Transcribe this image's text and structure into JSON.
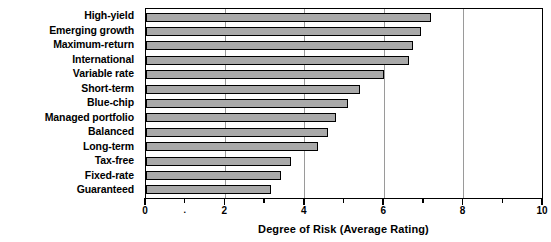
{
  "chart_data": {
    "type": "bar",
    "orientation": "horizontal",
    "title": "",
    "xlabel": "Degree of Risk (Average Rating)",
    "ylabel": "",
    "xlim": [
      0,
      10
    ],
    "grid": true,
    "legend": null,
    "bar_color": "#a9a9a9",
    "bar_edge_color": "#000000",
    "background_color": "#ffffff",
    "x_major_ticks": [
      0,
      2,
      4,
      6,
      8,
      10
    ],
    "x_minor_ticks": [
      1,
      3,
      5,
      7,
      9
    ],
    "x_tick_labels": [
      "0",
      "",
      "2",
      "4",
      "6",
      "8",
      "10"
    ],
    "gridline_values": [
      2,
      4,
      6,
      8
    ],
    "categories": [
      "High-yield",
      "Emerging growth",
      "Maximum-return",
      "International",
      "Variable rate",
      "Short-term",
      "Blue-chip",
      "Managed portfolio",
      "Balanced",
      "Long-term",
      "Tax-free",
      "Fixed-rate",
      "Guaranteed"
    ],
    "values": [
      7.2,
      6.95,
      6.75,
      6.65,
      6.0,
      5.4,
      5.1,
      4.8,
      4.6,
      4.35,
      3.65,
      3.4,
      3.15
    ]
  },
  "axis": {
    "x_title": "Degree of Risk (Average Rating)",
    "labels": {
      "t0": "0",
      "t1": ".",
      "t2": "2",
      "t4": "4",
      "t6": "6",
      "t8": "8",
      "t10": "10"
    }
  },
  "categories": {
    "c0": "High-yield",
    "c1": "Emerging growth",
    "c2": "Maximum-return",
    "c3": "International",
    "c4": "Variable rate",
    "c5": "Short-term",
    "c6": "Blue-chip",
    "c7": "Managed portfolio",
    "c8": "Balanced",
    "c9": "Long-term",
    "c10": "Tax-free",
    "c11": "Fixed-rate",
    "c12": "Guaranteed"
  }
}
